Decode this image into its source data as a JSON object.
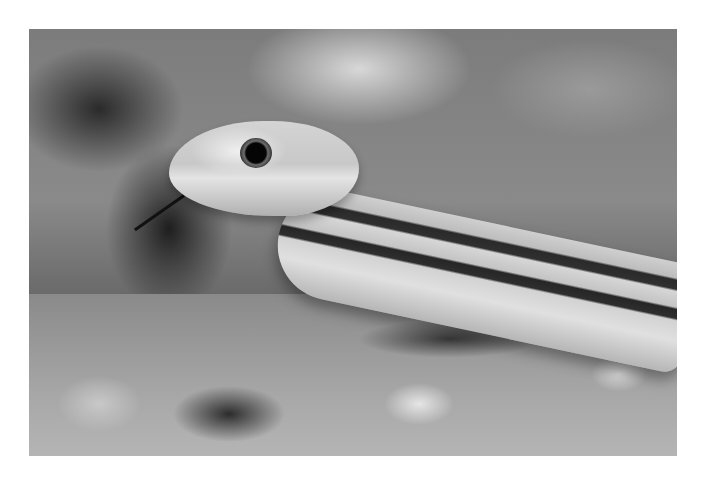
{
  "image": {
    "description": "Black-and-white close-up photograph of a striped snake with its head raised above pebbly ground",
    "subject": "snake",
    "colors": {
      "page_background": "#ffffff",
      "snake_stripe": "#2a2a2a",
      "snake_scales": "#d0d0d0",
      "background_blur": "#7c7c7c"
    }
  }
}
